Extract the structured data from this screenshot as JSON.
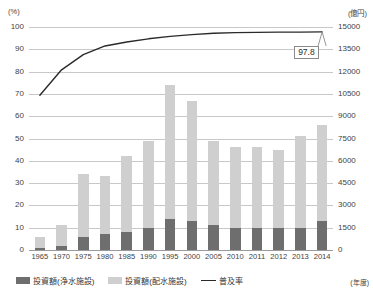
{
  "axes": {
    "left_unit": "(%)",
    "right_unit": "(億円)",
    "x_unit": "(年度)"
  },
  "callout": {
    "value": "97.8"
  },
  "legend": [
    {
      "label": "投資額(浄水施設)",
      "swatch": "dark",
      "color": "#6e6e6e"
    },
    {
      "label": "投資額(配水施設)",
      "swatch": "light",
      "color": "#cfcfcf"
    },
    {
      "label": "普及率",
      "swatch": "line",
      "color": "#2a2a2a"
    }
  ],
  "chart_data": {
    "type": "bar",
    "title": "",
    "xlabel": "(年度)",
    "ylabel": "(%)",
    "y2label": "(億円)",
    "ylim": [
      0,
      100
    ],
    "y2lim": [
      0,
      15000
    ],
    "yticks": [
      0,
      10,
      20,
      30,
      40,
      50,
      60,
      70,
      80,
      90,
      100
    ],
    "y2ticks": [
      0,
      1500,
      3000,
      4500,
      6000,
      7500,
      9000,
      10500,
      12000,
      13500,
      15000
    ],
    "grid": true,
    "legend_position": "bottom-left",
    "categories": [
      "1965",
      "1970",
      "1975",
      "1980",
      "1985",
      "1990",
      "1995",
      "2000",
      "2005",
      "2010",
      "2011",
      "2012",
      "2013",
      "2014"
    ],
    "series": [
      {
        "name": "投資額(浄水施設)",
        "unit": "億円",
        "axis": "right",
        "stack": "investment",
        "color": "#6e6e6e",
        "values": [
          150,
          300,
          900,
          1050,
          1200,
          1500,
          2100,
          1950,
          1650,
          1500,
          1500,
          1500,
          1500,
          1950
        ]
      },
      {
        "name": "投資額(配水施設)",
        "unit": "億円",
        "axis": "right",
        "stack": "investment",
        "color": "#cfcfcf",
        "values": [
          750,
          1350,
          4200,
          3900,
          5100,
          5850,
          9000,
          8100,
          5700,
          5400,
          5400,
          5250,
          6150,
          6450
        ]
      },
      {
        "name": "普及率",
        "unit": "%",
        "axis": "left",
        "type": "line",
        "color": "#2a2a2a",
        "values": [
          69.4,
          80.8,
          87.6,
          91.5,
          93.3,
          94.7,
          95.8,
          96.6,
          97.2,
          97.5,
          97.6,
          97.7,
          97.7,
          97.8
        ]
      }
    ],
    "annotations": [
      {
        "text": "97.8",
        "series": "普及率",
        "category": "2014",
        "value": 97.8
      }
    ]
  }
}
